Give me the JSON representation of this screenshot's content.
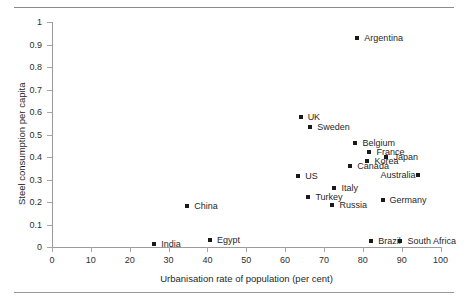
{
  "chart_data": {
    "type": "scatter",
    "title": "",
    "xlabel": "Urbanisation rate of population (per cent)",
    "ylabel": "Steel consumption per capita",
    "xlim": [
      0,
      100
    ],
    "ylim": [
      0,
      1
    ],
    "xticks": [
      0,
      10,
      20,
      30,
      40,
      50,
      60,
      70,
      80,
      90,
      100
    ],
    "yticks": [
      "0",
      "0.1",
      "0.2",
      "0.3",
      "0.4",
      "0.5",
      "0.6",
      "0.7",
      "0.8",
      "0.9",
      "1"
    ],
    "grid": false,
    "legend": false,
    "marker": "filled-square",
    "marker_color": "#1a1a1a",
    "points": [
      {
        "label": "Argentina",
        "x": 78.6,
        "y": 0.93,
        "label_side": "right"
      },
      {
        "label": "UK",
        "x": 64.0,
        "y": 0.578,
        "label_side": "right"
      },
      {
        "label": "Sweden",
        "x": 66.5,
        "y": 0.533,
        "label_side": "right"
      },
      {
        "label": "Belgium",
        "x": 78.1,
        "y": 0.462,
        "label_side": "right"
      },
      {
        "label": "France",
        "x": 81.7,
        "y": 0.422,
        "label_side": "right"
      },
      {
        "label": "Korea",
        "x": 81.2,
        "y": 0.382,
        "label_side": "right"
      },
      {
        "label": "Japan",
        "x": 86.1,
        "y": 0.4,
        "label_side": "right"
      },
      {
        "label": "Canada",
        "x": 76.8,
        "y": 0.36,
        "label_side": "right"
      },
      {
        "label": "Australia",
        "x": 94.1,
        "y": 0.32,
        "label_side": "left"
      },
      {
        "label": "US",
        "x": 63.4,
        "y": 0.315,
        "label_side": "right"
      },
      {
        "label": "Italy",
        "x": 72.7,
        "y": 0.262,
        "label_side": "right"
      },
      {
        "label": "Turkey",
        "x": 66.0,
        "y": 0.222,
        "label_side": "right"
      },
      {
        "label": "Russia",
        "x": 72.2,
        "y": 0.187,
        "label_side": "right"
      },
      {
        "label": "Germany",
        "x": 85.1,
        "y": 0.209,
        "label_side": "right"
      },
      {
        "label": "China",
        "x": 34.8,
        "y": 0.182,
        "label_side": "right"
      },
      {
        "label": "Brazil",
        "x": 82.2,
        "y": 0.027,
        "label_side": "right"
      },
      {
        "label": "South Africa",
        "x": 89.7,
        "y": 0.027,
        "label_side": "right"
      },
      {
        "label": "Egypt",
        "x": 40.7,
        "y": 0.031,
        "label_side": "right"
      },
      {
        "label": "India",
        "x": 26.3,
        "y": 0.013,
        "label_side": "right"
      }
    ]
  }
}
